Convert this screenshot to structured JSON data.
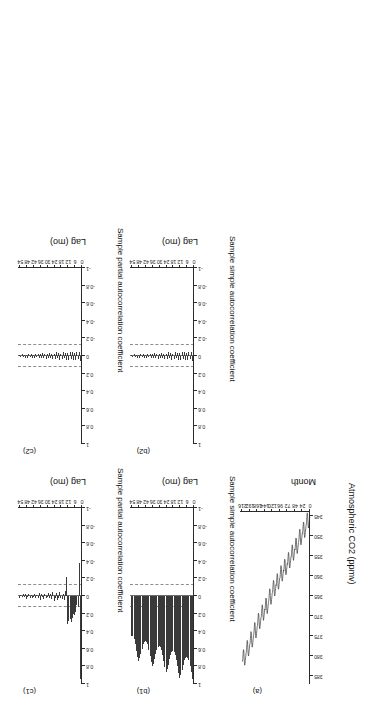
{
  "figure": {
    "caption_tags": [
      "(a)",
      "(b1)",
      "(c1)",
      "(b2)",
      "(c2)"
    ],
    "rotation_note": "180"
  },
  "panel_a": {
    "tag": "(a)",
    "xlabel": "Month",
    "ylabel": "Atmospheric CO2 (ppmv)",
    "xticks": [
      0,
      24,
      48,
      72,
      96,
      120,
      144,
      168,
      192,
      216
    ],
    "yticks": [
      345,
      350,
      355,
      360,
      365,
      370,
      375,
      380,
      385
    ]
  },
  "panel_b1": {
    "tag": "(b1)",
    "xlabel": "Lag (mo)",
    "ylabel": "Sample simple autocorrelation coefficient",
    "xticks": [
      0,
      6,
      12,
      18,
      24,
      30,
      36,
      42,
      48,
      54
    ],
    "yticks": [
      -1,
      -0.8,
      -0.6,
      -0.4,
      -0.2,
      0,
      0.2,
      0.4,
      0.6,
      0.8,
      1
    ]
  },
  "panel_c1": {
    "tag": "(c1)",
    "xlabel": "Lag (mo)",
    "ylabel": "Sample partial autocorrelation coefficient",
    "xticks": [
      0,
      6,
      12,
      18,
      24,
      30,
      36,
      42,
      48,
      54
    ],
    "yticks": [
      -1,
      -0.8,
      -0.6,
      -0.4,
      -0.2,
      0,
      0.2,
      0.4,
      0.6,
      0.8,
      1
    ]
  },
  "panel_b2": {
    "tag": "(b2)",
    "xlabel": "Lag (mo)",
    "ylabel": "Sample simple autocorrelation coefficient",
    "xticks": [
      0,
      6,
      12,
      18,
      24,
      30,
      36,
      42,
      48,
      54
    ],
    "yticks": [
      -1,
      -0.8,
      -0.6,
      -0.4,
      -0.2,
      0,
      0.2,
      0.4,
      0.6,
      0.8,
      1
    ]
  },
  "panel_c2": {
    "tag": "(c2)",
    "xlabel": "Lag (mo)",
    "ylabel": "Sample partial autocorrelation coefficient",
    "xticks": [
      0,
      6,
      12,
      18,
      24,
      30,
      36,
      42,
      48,
      54
    ],
    "yticks": [
      -1,
      -0.8,
      -0.6,
      -0.4,
      -0.2,
      0,
      0.2,
      0.4,
      0.6,
      0.8,
      1
    ]
  },
  "chart_data": [
    {
      "id": "a",
      "type": "line",
      "title": "(a)",
      "xlabel": "Month",
      "ylabel": "Atmospheric CO2 (ppmv)",
      "xlim": [
        0,
        224
      ],
      "ylim": [
        344,
        387
      ],
      "xticks": [
        0,
        24,
        48,
        72,
        96,
        120,
        144,
        168,
        192,
        216
      ],
      "yticks": [
        345,
        350,
        355,
        360,
        365,
        370,
        375,
        380,
        385
      ],
      "grid": false,
      "legend": "none",
      "x": [
        1,
        2,
        3,
        4,
        5,
        6,
        7,
        8,
        9,
        10,
        11,
        12,
        13,
        14,
        15,
        16,
        17,
        18,
        19,
        20,
        21,
        22,
        23,
        24,
        25,
        26,
        27,
        28,
        29,
        30,
        31,
        32,
        33,
        34,
        35,
        36,
        37,
        38,
        39,
        40,
        41,
        42,
        43,
        44,
        45,
        46,
        47,
        48,
        49,
        50,
        51,
        52,
        53,
        54,
        55,
        56,
        57,
        58,
        59,
        60,
        61,
        62,
        63,
        64,
        65,
        66,
        67,
        68,
        69,
        70,
        71,
        72,
        73,
        74,
        75,
        76,
        77,
        78,
        79,
        80,
        81,
        82,
        83,
        84,
        85,
        86,
        87,
        88,
        89,
        90,
        91,
        92,
        93,
        94,
        95,
        96,
        97,
        98,
        99,
        100,
        101,
        102,
        103,
        104,
        105,
        106,
        107,
        108,
        109,
        110,
        111,
        112,
        113,
        114,
        115,
        116,
        117,
        118,
        119,
        120,
        121,
        122,
        123,
        124,
        125,
        126,
        127,
        128,
        129,
        130,
        131,
        132,
        133,
        134,
        135,
        136,
        137,
        138,
        139,
        140,
        141,
        142,
        143,
        144,
        145,
        146,
        147,
        148,
        149,
        150,
        151,
        152,
        153,
        154,
        155,
        156,
        157,
        158,
        159,
        160,
        161,
        162,
        163,
        164,
        165,
        166,
        167,
        168,
        169,
        170,
        171,
        172,
        173,
        174,
        175,
        176,
        177,
        178,
        179,
        180,
        181,
        182,
        183,
        184,
        185,
        186,
        187,
        188,
        189,
        190,
        191,
        192,
        193,
        194,
        195,
        196,
        197,
        198,
        199,
        200,
        201,
        202,
        203,
        204,
        205,
        206,
        207,
        208,
        209,
        210,
        211,
        212,
        213,
        214,
        215,
        216
      ],
      "y": [
        345.2,
        346.1,
        346.9,
        347.6,
        348.0,
        347.3,
        345.8,
        344.4,
        344.2,
        345.2,
        346.4,
        347.2,
        347.6,
        348.5,
        349.2,
        350.0,
        350.4,
        349.7,
        348.2,
        346.7,
        346.5,
        347.5,
        348.7,
        349.5,
        349.4,
        350.3,
        351.0,
        351.8,
        352.2,
        351.5,
        350.0,
        348.5,
        348.3,
        349.3,
        350.5,
        351.3,
        351.6,
        352.5,
        353.2,
        354.0,
        354.4,
        353.7,
        352.2,
        350.7,
        350.5,
        351.5,
        352.7,
        353.5,
        353.3,
        354.2,
        354.9,
        355.7,
        356.1,
        355.4,
        353.9,
        352.4,
        352.2,
        353.2,
        354.4,
        355.2,
        355.2,
        356.1,
        356.8,
        357.6,
        358.0,
        357.3,
        355.8,
        354.3,
        354.1,
        355.1,
        356.3,
        357.1,
        356.9,
        357.8,
        358.5,
        359.3,
        359.7,
        359.0,
        357.5,
        356.0,
        355.8,
        356.8,
        358.0,
        358.8,
        358.5,
        359.4,
        360.1,
        360.9,
        361.3,
        360.6,
        359.1,
        357.6,
        357.4,
        358.4,
        359.6,
        360.4,
        360.5,
        361.4,
        362.1,
        362.9,
        363.3,
        362.6,
        361.1,
        359.6,
        359.4,
        360.4,
        361.6,
        362.4,
        362.2,
        363.1,
        363.8,
        364.6,
        365.0,
        364.3,
        362.8,
        361.3,
        361.1,
        362.1,
        363.3,
        364.1,
        364.3,
        365.2,
        365.9,
        366.7,
        367.1,
        366.4,
        364.9,
        363.4,
        363.2,
        364.2,
        365.4,
        366.2,
        366.6,
        367.5,
        368.2,
        369.0,
        369.4,
        368.7,
        367.2,
        365.7,
        365.5,
        366.5,
        367.7,
        368.5,
        368.3,
        369.2,
        369.9,
        370.7,
        371.1,
        370.4,
        368.9,
        367.4,
        367.2,
        368.2,
        369.4,
        370.2,
        370.4,
        371.3,
        372.0,
        372.8,
        373.2,
        372.5,
        371.0,
        369.5,
        369.3,
        370.3,
        371.5,
        372.3,
        372.7,
        373.6,
        374.3,
        375.1,
        375.5,
        374.8,
        373.3,
        371.8,
        371.6,
        372.6,
        373.8,
        374.6,
        375.0,
        375.9,
        376.6,
        377.4,
        377.8,
        377.1,
        375.6,
        374.1,
        373.9,
        374.9,
        376.1,
        376.9,
        377.2,
        378.1,
        378.8,
        379.6,
        380.0,
        379.3,
        377.8,
        376.3,
        376.1,
        377.1,
        378.3,
        379.1,
        379.5,
        380.4,
        381.1,
        381.9,
        382.3,
        381.6,
        380.1,
        378.6,
        378.4,
        379.4,
        380.6,
        381.4
      ]
    },
    {
      "id": "b1",
      "type": "bar",
      "title": "(b1)",
      "xlabel": "Lag (mo)",
      "ylabel": "Sample simple autocorrelation coefficient",
      "xlim": [
        0,
        56
      ],
      "ylim": [
        -1,
        1
      ],
      "xticks": [
        0,
        6,
        12,
        18,
        24,
        30,
        36,
        42,
        48,
        54
      ],
      "yticks": [
        -1,
        -0.8,
        -0.6,
        -0.4,
        -0.2,
        0,
        0.2,
        0.4,
        0.6,
        0.8,
        1
      ],
      "confidence_bounds": [
        -0.13,
        0.13
      ],
      "grid": false,
      "legend": "none",
      "categories": [
        1,
        2,
        3,
        4,
        5,
        6,
        7,
        8,
        9,
        10,
        11,
        12,
        13,
        14,
        15,
        16,
        17,
        18,
        19,
        20,
        21,
        22,
        23,
        24,
        25,
        26,
        27,
        28,
        29,
        30,
        31,
        32,
        33,
        34,
        35,
        36,
        37,
        38,
        39,
        40,
        41,
        42,
        43,
        44,
        45,
        46,
        47,
        48,
        49,
        50,
        51,
        52,
        53,
        54
      ],
      "values": [
        0.94,
        0.86,
        0.79,
        0.73,
        0.7,
        0.69,
        0.7,
        0.73,
        0.78,
        0.84,
        0.9,
        0.93,
        0.88,
        0.8,
        0.73,
        0.67,
        0.64,
        0.63,
        0.64,
        0.67,
        0.72,
        0.78,
        0.83,
        0.86,
        0.81,
        0.74,
        0.67,
        0.61,
        0.58,
        0.57,
        0.58,
        0.61,
        0.66,
        0.72,
        0.77,
        0.8,
        0.75,
        0.68,
        0.61,
        0.55,
        0.52,
        0.51,
        0.52,
        0.55,
        0.6,
        0.66,
        0.71,
        0.74,
        0.69,
        0.62,
        0.55,
        0.49,
        0.46,
        0.45
      ]
    },
    {
      "id": "c1",
      "type": "bar",
      "title": "(c1)",
      "xlabel": "Lag (mo)",
      "ylabel": "Sample partial autocorrelation coefficient",
      "xlim": [
        0,
        56
      ],
      "ylim": [
        -1,
        1
      ],
      "xticks": [
        0,
        6,
        12,
        18,
        24,
        30,
        36,
        42,
        48,
        54
      ],
      "yticks": [
        -1,
        -0.8,
        -0.6,
        -0.4,
        -0.2,
        0,
        0.2,
        0.4,
        0.6,
        0.8,
        1
      ],
      "confidence_bounds": [
        -0.13,
        0.13
      ],
      "grid": false,
      "legend": "none",
      "categories": [
        1,
        2,
        3,
        4,
        5,
        6,
        7,
        8,
        9,
        10,
        11,
        12,
        13,
        14,
        15,
        16,
        17,
        18,
        19,
        20,
        21,
        22,
        23,
        24,
        25,
        26,
        27,
        28,
        29,
        30,
        31,
        32,
        33,
        34,
        35,
        36,
        37,
        38,
        39,
        40,
        41,
        42,
        43,
        44,
        45,
        46,
        47,
        48,
        49,
        50,
        51,
        52,
        53,
        54
      ],
      "values": [
        0.94,
        -0.38,
        0.12,
        0.1,
        0.18,
        0.22,
        0.21,
        0.25,
        0.3,
        0.26,
        0.28,
        0.32,
        -0.22,
        -0.06,
        0.04,
        -0.02,
        0.03,
        0.02,
        -0.04,
        0.02,
        0.05,
        -0.03,
        0.02,
        0.06,
        -0.05,
        0.03,
        -0.02,
        0.02,
        -0.03,
        0.01,
        0.02,
        -0.02,
        0.03,
        0.01,
        -0.02,
        0.04,
        -0.03,
        0.02,
        -0.01,
        0.02,
        -0.02,
        0.01,
        0.02,
        -0.01,
        0.02,
        -0.02,
        0.01,
        0.03,
        -0.02,
        0.01,
        -0.02,
        0.01,
        -0.01,
        0.02
      ]
    },
    {
      "id": "b2",
      "type": "bar",
      "title": "(b2)",
      "xlabel": "Lag (mo)",
      "ylabel": "Sample simple autocorrelation coefficient",
      "xlim": [
        0,
        56
      ],
      "ylim": [
        -1,
        1
      ],
      "xticks": [
        0,
        6,
        12,
        18,
        24,
        30,
        36,
        42,
        48,
        54
      ],
      "yticks": [
        -1,
        -0.8,
        -0.6,
        -0.4,
        -0.2,
        0,
        0.2,
        0.4,
        0.6,
        0.8,
        1
      ],
      "confidence_bounds": [
        -0.13,
        0.13
      ],
      "grid": false,
      "legend": "none",
      "categories": [
        1,
        2,
        3,
        4,
        5,
        6,
        7,
        8,
        9,
        10,
        11,
        12,
        13,
        14,
        15,
        16,
        17,
        18,
        19,
        20,
        21,
        22,
        23,
        24,
        25,
        26,
        27,
        28,
        29,
        30,
        31,
        32,
        33,
        34,
        35,
        36,
        37,
        38,
        39,
        40,
        41,
        42,
        43,
        44,
        45,
        46,
        47,
        48,
        49,
        50,
        51,
        52,
        53,
        54
      ],
      "values": [
        0.06,
        -0.04,
        0.03,
        -0.05,
        0.04,
        -0.03,
        0.05,
        -0.04,
        0.03,
        -0.05,
        0.04,
        -0.03,
        0.04,
        -0.03,
        0.02,
        -0.04,
        0.03,
        -0.02,
        0.04,
        -0.03,
        0.02,
        -0.04,
        0.03,
        -0.02,
        0.03,
        -0.02,
        0.02,
        -0.03,
        0.02,
        -0.02,
        0.03,
        -0.02,
        0.02,
        -0.03,
        0.02,
        -0.02,
        0.02,
        -0.02,
        0.01,
        -0.02,
        0.02,
        -0.01,
        0.02,
        -0.02,
        0.01,
        -0.02,
        0.02,
        -0.01,
        0.02,
        -0.01,
        0.01,
        -0.02,
        0.01,
        -0.01
      ]
    },
    {
      "id": "c2",
      "type": "bar",
      "title": "(c2)",
      "xlabel": "Lag (mo)",
      "ylabel": "Sample partial autocorrelation coefficient",
      "xlim": [
        0,
        56
      ],
      "ylim": [
        -1,
        1
      ],
      "xticks": [
        0,
        6,
        12,
        18,
        24,
        30,
        36,
        42,
        48,
        54
      ],
      "yticks": [
        -1,
        -0.8,
        -0.6,
        -0.4,
        -0.2,
        0,
        0.2,
        0.4,
        0.6,
        0.8,
        1
      ],
      "confidence_bounds": [
        -0.13,
        0.13
      ],
      "grid": false,
      "legend": "none",
      "categories": [
        1,
        2,
        3,
        4,
        5,
        6,
        7,
        8,
        9,
        10,
        11,
        12,
        13,
        14,
        15,
        16,
        17,
        18,
        19,
        20,
        21,
        22,
        23,
        24,
        25,
        26,
        27,
        28,
        29,
        30,
        31,
        32,
        33,
        34,
        35,
        36,
        37,
        38,
        39,
        40,
        41,
        42,
        43,
        44,
        45,
        46,
        47,
        48,
        49,
        50,
        51,
        52,
        53,
        54
      ],
      "values": [
        0.06,
        -0.04,
        0.03,
        -0.05,
        0.04,
        -0.03,
        0.05,
        -0.04,
        0.03,
        -0.05,
        0.04,
        -0.03,
        0.04,
        -0.03,
        0.02,
        -0.04,
        0.03,
        -0.02,
        0.04,
        -0.03,
        0.02,
        -0.04,
        0.03,
        -0.02,
        0.03,
        -0.02,
        0.02,
        -0.03,
        0.02,
        -0.02,
        0.03,
        -0.02,
        0.02,
        -0.03,
        0.02,
        -0.02,
        0.02,
        -0.02,
        0.01,
        -0.02,
        0.02,
        -0.01,
        0.02,
        -0.02,
        0.01,
        -0.02,
        0.02,
        -0.01,
        0.02,
        -0.01,
        0.01,
        -0.02,
        0.01,
        -0.01
      ]
    }
  ]
}
